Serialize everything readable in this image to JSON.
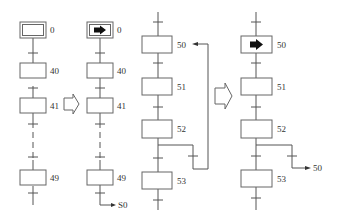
{
  "diagram": {
    "type": "SFC / GRAFCET step transition illustration",
    "panels": [
      {
        "id": "panel-1",
        "description": "Initial step 0 inactive, sequence 40-41-...-49",
        "steps": [
          {
            "label": "0",
            "initial": true,
            "active": false
          },
          {
            "label": "40",
            "initial": false,
            "active": false
          },
          {
            "label": "41",
            "initial": false,
            "active": false
          },
          {
            "label": "49",
            "initial": false,
            "active": false
          }
        ],
        "dashed_gap_between": [
          "41",
          "49"
        ]
      },
      {
        "id": "panel-2",
        "description": "Initial step 0 active, sequence ends with jump to S0",
        "steps": [
          {
            "label": "0",
            "initial": true,
            "active": true
          },
          {
            "label": "40",
            "initial": false,
            "active": false
          },
          {
            "label": "41",
            "initial": false,
            "active": false
          },
          {
            "label": "49",
            "initial": false,
            "active": false
          }
        ],
        "dashed_gap_between": [
          "41",
          "49"
        ],
        "jump_label": "S0"
      },
      {
        "id": "panel-3",
        "description": "Loop from 52 back to 50 drawn as line",
        "steps": [
          {
            "label": "50",
            "active": false
          },
          {
            "label": "51",
            "active": false
          },
          {
            "label": "52",
            "active": false
          },
          {
            "label": "53",
            "active": false
          }
        ]
      },
      {
        "id": "panel-4",
        "description": "Step 50 active, loop expressed as jump arrow to 50",
        "steps": [
          {
            "label": "50",
            "active": true
          },
          {
            "label": "51",
            "active": false
          },
          {
            "label": "52",
            "active": false
          },
          {
            "label": "53",
            "active": false
          }
        ],
        "jump_label": "50"
      }
    ],
    "equivalence_arrows": 2,
    "colors": {
      "line": "#555555",
      "box_border": "#666666",
      "active_marker": "#111111",
      "text": "#333333",
      "background": "#ffffff"
    }
  }
}
